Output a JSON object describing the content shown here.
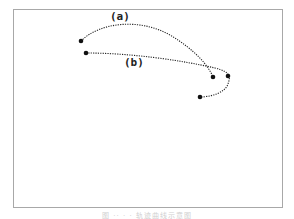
{
  "figure": {
    "labels": {
      "a": "(a)",
      "b": "(b)"
    },
    "caption": "图 ·· · · 轨迹曲线示意图",
    "colors": {
      "stroke": "#222222",
      "frame": "#a8a8a8",
      "caption": "#d0d0d0"
    },
    "curves": [
      {
        "name": "a",
        "start": [
          81,
          41
        ],
        "end": [
          213,
          77
        ]
      },
      {
        "name": "b",
        "start": [
          86,
          53
        ],
        "via": [
          228,
          76
        ],
        "end": [
          200,
          97
        ]
      }
    ]
  }
}
